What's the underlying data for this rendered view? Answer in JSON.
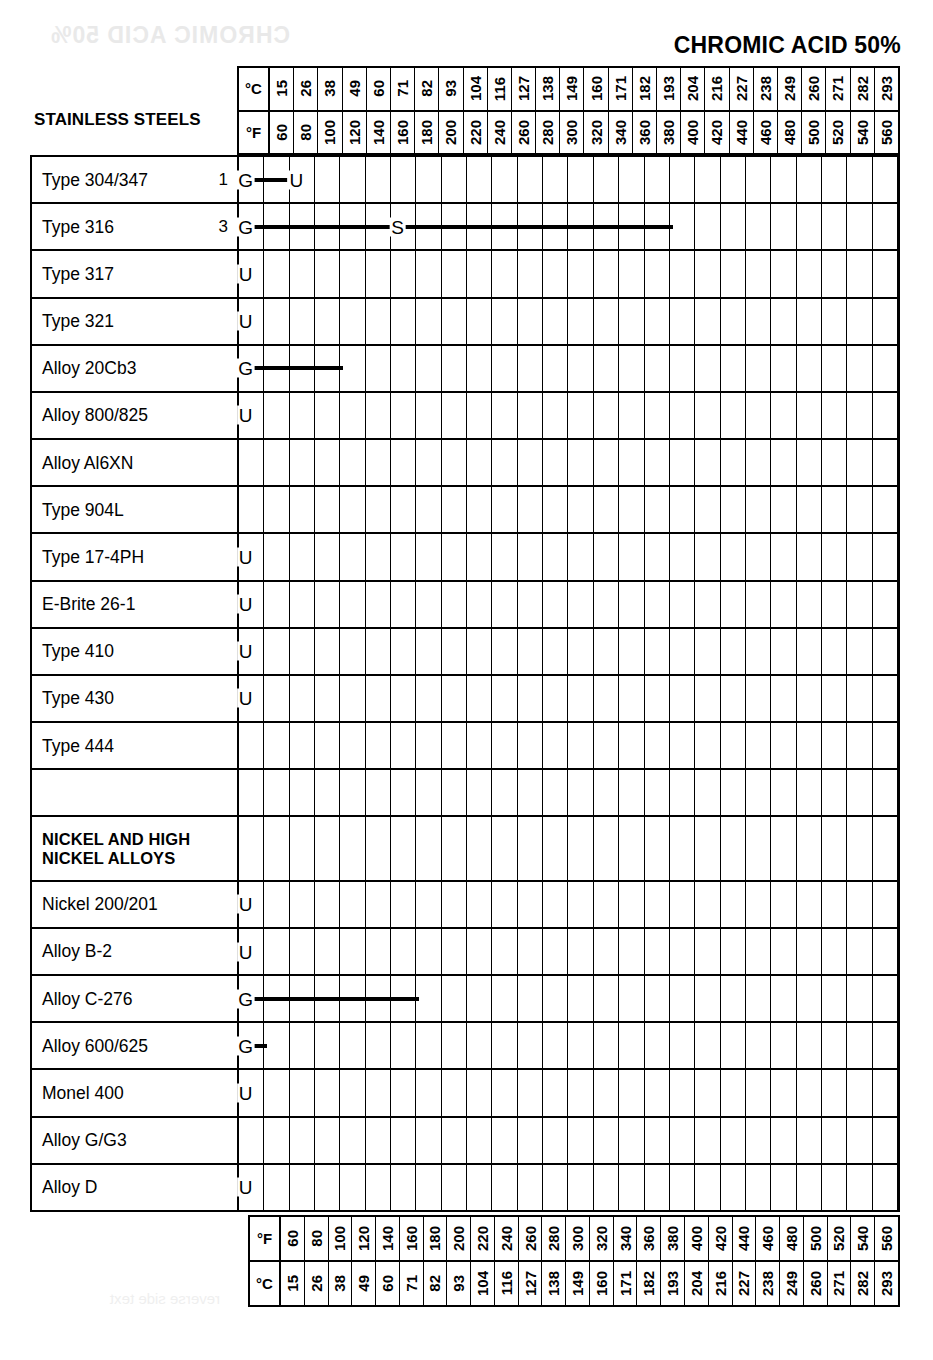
{
  "title": "CHROMIC ACID 50%",
  "axis": {
    "unit_c_label": "°C",
    "unit_f_label": "°F",
    "celsius": [
      "15",
      "26",
      "38",
      "49",
      "60",
      "71",
      "82",
      "93",
      "104",
      "116",
      "127",
      "138",
      "149",
      "160",
      "171",
      "182",
      "193",
      "204",
      "216",
      "227",
      "238",
      "249",
      "260",
      "271",
      "282",
      "293"
    ],
    "fahrenheit": [
      "60",
      "80",
      "100",
      "120",
      "140",
      "160",
      "180",
      "200",
      "220",
      "240",
      "260",
      "280",
      "300",
      "320",
      "340",
      "360",
      "380",
      "400",
      "420",
      "440",
      "460",
      "480",
      "500",
      "520",
      "540",
      "560"
    ]
  },
  "group_caption": "STAINLESS STEELS",
  "legend_codes": {
    "G": "G",
    "U": "U",
    "S": "S"
  },
  "rows": [
    {
      "label": "Type 304/347",
      "note": "1",
      "section": false
    },
    {
      "label": "Type 316",
      "note": "3",
      "section": false
    },
    {
      "label": "Type 317",
      "note": "",
      "section": false
    },
    {
      "label": "Type 321",
      "note": "",
      "section": false
    },
    {
      "label": "Alloy 20Cb3",
      "note": "",
      "section": false
    },
    {
      "label": "Alloy 800/825",
      "note": "",
      "section": false
    },
    {
      "label": "Alloy Al6XN",
      "note": "",
      "section": false
    },
    {
      "label": "Type 904L",
      "note": "",
      "section": false
    },
    {
      "label": "Type 17-4PH",
      "note": "",
      "section": false
    },
    {
      "label": "E-Brite 26-1",
      "note": "",
      "section": false
    },
    {
      "label": "Type 410",
      "note": "",
      "section": false
    },
    {
      "label": "Type 430",
      "note": "",
      "section": false
    },
    {
      "label": "Type 444",
      "note": "",
      "section": false
    },
    {
      "label": "",
      "note": "",
      "section": false
    },
    {
      "label": "NICKEL AND HIGH\nNICKEL ALLOYS",
      "note": "",
      "section": true
    },
    {
      "label": "Nickel 200/201",
      "note": "",
      "section": false
    },
    {
      "label": "Alloy B-2",
      "note": "",
      "section": false
    },
    {
      "label": "Alloy C-276",
      "note": "",
      "section": false
    },
    {
      "label": "Alloy 600/625",
      "note": "",
      "section": false
    },
    {
      "label": "Monel 400",
      "note": "",
      "section": false
    },
    {
      "label": "Alloy G/G3",
      "note": "",
      "section": false
    },
    {
      "label": "Alloy D",
      "note": "",
      "section": false
    }
  ],
  "chart_data": {
    "type": "table",
    "title": "CHROMIC ACID 50%",
    "xlabel": "Temperature",
    "ylabel": "Alloy",
    "x_units": [
      "°F",
      "°C"
    ],
    "x_ticks_f": [
      60,
      80,
      100,
      120,
      140,
      160,
      180,
      200,
      220,
      240,
      260,
      280,
      300,
      320,
      340,
      360,
      380,
      400,
      420,
      440,
      460,
      480,
      500,
      520,
      540,
      560
    ],
    "x_ticks_c": [
      15,
      26,
      38,
      49,
      60,
      71,
      82,
      93,
      104,
      116,
      127,
      138,
      149,
      160,
      171,
      182,
      193,
      204,
      216,
      227,
      238,
      249,
      260,
      271,
      282,
      293
    ],
    "rating_key": {
      "G": "Good / generally resistant",
      "S": "Satisfactory limited",
      "U": "Unsatisfactory"
    },
    "grid": true,
    "legend": "none",
    "series": [
      {
        "name": "Type 304/347",
        "note": "1",
        "markers": [
          {
            "code": "G",
            "f": 60
          },
          {
            "code": "U",
            "f": 100
          }
        ],
        "bars": [
          {
            "from_f": 60,
            "to_f": 100
          }
        ]
      },
      {
        "name": "Type 316",
        "note": "3",
        "markers": [
          {
            "code": "G",
            "f": 60
          },
          {
            "code": "S",
            "f": 180
          }
        ],
        "bars": [
          {
            "from_f": 60,
            "to_f": 180
          },
          {
            "from_f": 180,
            "to_f": 400
          }
        ]
      },
      {
        "name": "Type 317",
        "markers": [
          {
            "code": "U",
            "f": 60
          }
        ],
        "bars": []
      },
      {
        "name": "Type 321",
        "markers": [
          {
            "code": "U",
            "f": 60
          }
        ],
        "bars": []
      },
      {
        "name": "Alloy 20Cb3",
        "markers": [
          {
            "code": "G",
            "f": 60
          }
        ],
        "bars": [
          {
            "from_f": 60,
            "to_f": 140
          }
        ]
      },
      {
        "name": "Alloy 800/825",
        "markers": [
          {
            "code": "U",
            "f": 60
          }
        ],
        "bars": []
      },
      {
        "name": "Alloy Al6XN",
        "markers": [],
        "bars": []
      },
      {
        "name": "Type 904L",
        "markers": [],
        "bars": []
      },
      {
        "name": "Type 17-4PH",
        "markers": [
          {
            "code": "U",
            "f": 60
          }
        ],
        "bars": []
      },
      {
        "name": "E-Brite 26-1",
        "markers": [
          {
            "code": "U",
            "f": 60
          }
        ],
        "bars": []
      },
      {
        "name": "Type 410",
        "markers": [
          {
            "code": "U",
            "f": 60
          }
        ],
        "bars": []
      },
      {
        "name": "Type 430",
        "markers": [
          {
            "code": "U",
            "f": 60
          }
        ],
        "bars": []
      },
      {
        "name": "Type 444",
        "markers": [],
        "bars": []
      },
      {
        "name": "",
        "markers": [],
        "bars": []
      },
      {
        "name": "NICKEL AND HIGH NICKEL ALLOYS",
        "markers": [],
        "bars": []
      },
      {
        "name": "Nickel 200/201",
        "markers": [
          {
            "code": "U",
            "f": 60
          }
        ],
        "bars": []
      },
      {
        "name": "Alloy B-2",
        "markers": [
          {
            "code": "U",
            "f": 60
          }
        ],
        "bars": []
      },
      {
        "name": "Alloy C-276",
        "markers": [
          {
            "code": "G",
            "f": 60
          }
        ],
        "bars": [
          {
            "from_f": 60,
            "to_f": 200
          }
        ]
      },
      {
        "name": "Alloy 600/625",
        "markers": [
          {
            "code": "G",
            "f": 60
          }
        ],
        "bars": [
          {
            "from_f": 60,
            "to_f": 80
          }
        ]
      },
      {
        "name": "Monel 400",
        "markers": [
          {
            "code": "U",
            "f": 60
          }
        ],
        "bars": []
      },
      {
        "name": "Alloy G/G3",
        "markers": [],
        "bars": []
      },
      {
        "name": "Alloy D",
        "markers": [
          {
            "code": "U",
            "f": 60
          }
        ],
        "bars": []
      }
    ]
  }
}
